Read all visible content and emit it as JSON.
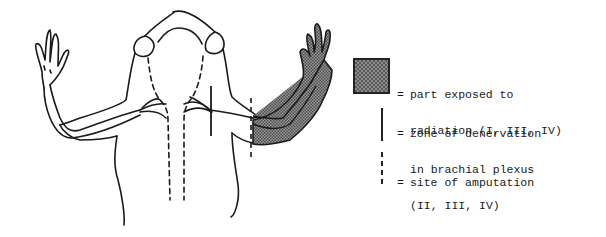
{
  "legend": {
    "items": [
      {
        "symbol": "shaded-box",
        "equals": "=",
        "line1": "part exposed to",
        "line2": "radiation (I, III, IV)"
      },
      {
        "symbol": "solid-line",
        "equals": "=",
        "line1": "zone of denervation",
        "line2": "in brachial plexus",
        "line3": "(II, III, IV)"
      },
      {
        "symbol": "dashed-line",
        "equals": "=",
        "line1": "site of amputation"
      }
    ]
  },
  "colors": {
    "ink": "#1a1a1a",
    "shade": "#8a8a8a",
    "background": "#ffffff"
  }
}
